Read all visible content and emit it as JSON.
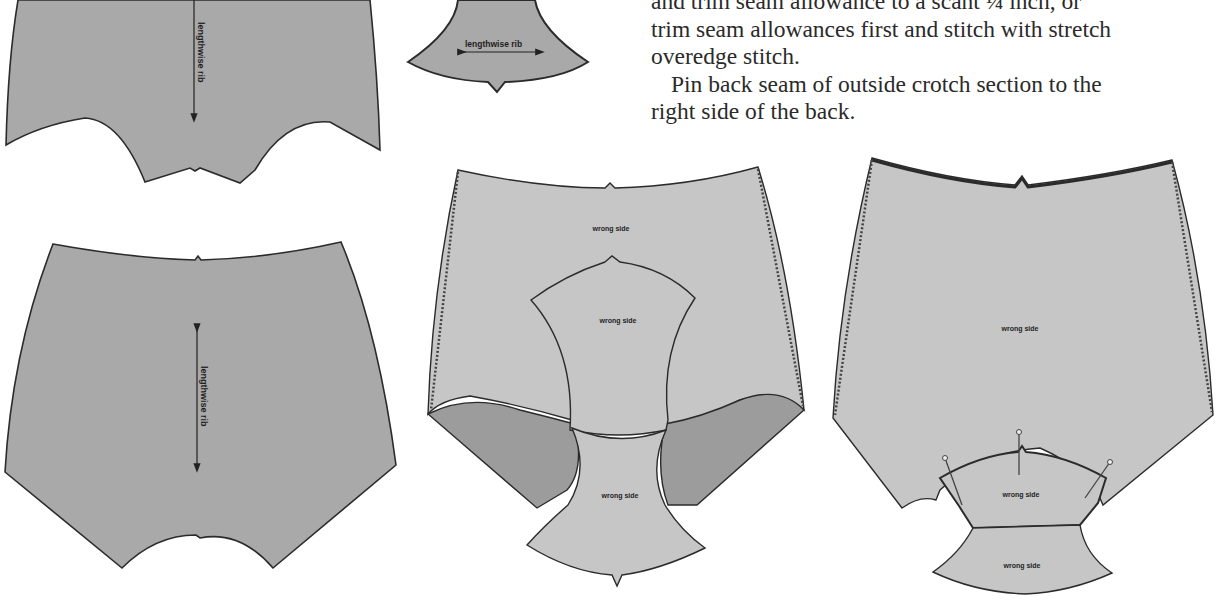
{
  "instructions": {
    "lines": [
      "and trim seam allowance to a scant ¼ inch, or",
      "trim seam allowances first and stitch with stretch",
      "overedge stitch.",
      "Pin back seam of outside crotch section to the",
      "right side of the back."
    ]
  },
  "figures": {
    "front_piece_top": {
      "grain_label": "lengthwise rib"
    },
    "crotch_piece_small": {
      "grain_label": "lengthwise rib"
    },
    "back_piece": {
      "grain_label": "lengthwise rib"
    },
    "assembled_front": {
      "labels": [
        "wrong side",
        "wrong side",
        "wrong side"
      ]
    },
    "assembled_back": {
      "labels": [
        "wrong side",
        "wrong side",
        "wrong side"
      ]
    }
  },
  "colors": {
    "fabric_right_side": "#a9a9a9",
    "fabric_wrong_side": "#c6c6c6",
    "fabric_shadow": "#9c9c9c",
    "outline": "#2b2b2b",
    "text": "#2a2a2a"
  }
}
